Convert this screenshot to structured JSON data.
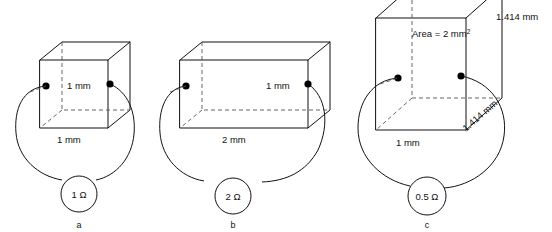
{
  "figure": {
    "background": "#ffffff",
    "line_color": "#111111",
    "hidden_edge_color": "#555555",
    "width": 552,
    "height": 232
  },
  "panels": [
    {
      "id": "a",
      "caption": "a",
      "shape": "cube",
      "resistance": "1 Ω",
      "labels": {
        "height": "1 mm",
        "width": "1 mm"
      },
      "terminals": 2
    },
    {
      "id": "b",
      "caption": "b",
      "shape": "rectangular-box",
      "resistance": "2 Ω",
      "labels": {
        "height": "1 mm",
        "width": "2 mm"
      },
      "terminals": 2
    },
    {
      "id": "c",
      "caption": "c",
      "shape": "tall-rectangular-box",
      "resistance": "0.5 Ω",
      "labels": {
        "area": "Area = 2 mm",
        "area_exponent": "2",
        "height": "1.414 mm",
        "depth": "1.414 mm",
        "width": "1 mm"
      },
      "terminals": 2
    }
  ]
}
